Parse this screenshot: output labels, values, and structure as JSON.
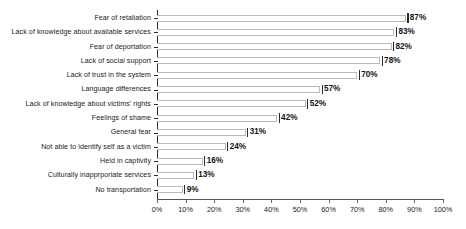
{
  "chart_data": {
    "type": "bar",
    "orientation": "horizontal",
    "title": "",
    "subtitle": "",
    "xlabel": "",
    "ylabel": "",
    "xlim": [
      0,
      100
    ],
    "xticks": [
      "0%",
      "10%",
      "20%",
      "30%",
      "40%",
      "50%",
      "60%",
      "70%",
      "80%",
      "90%",
      "100%"
    ],
    "xtick_values": [
      0,
      10,
      20,
      30,
      40,
      50,
      60,
      70,
      80,
      90,
      100
    ],
    "grid": false,
    "legend": null,
    "value_suffix": "%",
    "categories": [
      "Fear of retaliation",
      "Lack of knowledge about available services",
      "Fear of deportation",
      "Lack of social support",
      "Lack of trust in the system",
      "Language differences",
      "Lack of knowledge about victims' rights",
      "Feelings of shame",
      "General fear",
      "Not able to identify self as a victim",
      "Held in captivity",
      "Culturally inapprporiate services",
      "No transportation"
    ],
    "values": [
      87,
      83,
      82,
      78,
      70,
      57,
      52,
      42,
      31,
      24,
      16,
      13,
      9
    ],
    "data_labels": [
      "87%",
      "83%",
      "82%",
      "78%",
      "70%",
      "57%",
      "52%",
      "42%",
      "31%",
      "24%",
      "16%",
      "13%",
      "9%"
    ],
    "colors": {
      "bar_outline": "#b9b9b9",
      "bar_fill": "#ffffff",
      "axis": "#2b2b2b",
      "text": "#1a1a1a",
      "background": "#ffffff"
    }
  }
}
